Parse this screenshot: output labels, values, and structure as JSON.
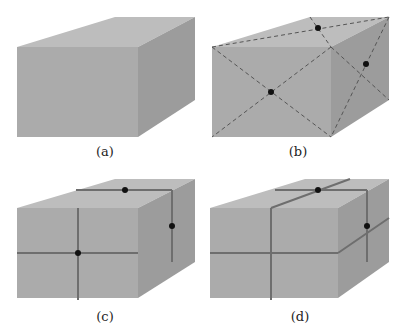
{
  "figure": {
    "panels": [
      {
        "id": "a",
        "label": "(a)",
        "description": "plain rectangular box",
        "markers": 0
      },
      {
        "id": "b",
        "label": "(b)",
        "description": "box with dashed face diagonals and centre dots on front, top and right faces",
        "markers": 3
      },
      {
        "id": "c",
        "label": "(c)",
        "description": "box with solid lines through face centres on front, top and right faces",
        "markers": 3
      },
      {
        "id": "d",
        "label": "(d)",
        "description": "box with continuous solid bands wrapping around, dots on top and right faces",
        "markers": 2
      }
    ],
    "colors": {
      "front_face": "#a9a9a9",
      "top_face": "#bdbdbd",
      "side_face": "#9a9a9a",
      "line": "#6e6e6e",
      "dashed": "#555555",
      "dot": "#111111"
    }
  }
}
